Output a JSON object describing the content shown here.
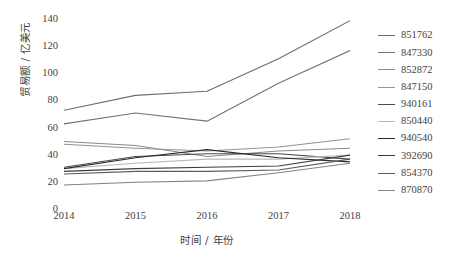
{
  "chart_data": {
    "type": "line",
    "title": "",
    "xlabel": "时间 / 年份",
    "ylabel": "贸易额 / 亿美元",
    "categories": [
      "2014",
      "2015",
      "2016",
      "2017",
      "2018"
    ],
    "x": [
      2014,
      2015,
      2016,
      2017,
      2018
    ],
    "xlim": [
      2014,
      2018
    ],
    "ylim": [
      0,
      140
    ],
    "yticks": [
      0,
      20,
      40,
      60,
      80,
      100,
      120,
      140
    ],
    "grid": false,
    "legend_position": "right",
    "series": [
      {
        "name": "851762",
        "values": [
          72,
          83,
          86,
          110,
          138
        ],
        "color": "#6e6e6e"
      },
      {
        "name": "847330",
        "values": [
          62,
          70,
          64,
          92,
          116
        ],
        "color": "#737373"
      },
      {
        "name": "852872",
        "values": [
          49,
          46,
          38,
          42,
          44
        ],
        "color": "#8a8a8a"
      },
      {
        "name": "847150",
        "values": [
          47,
          44,
          42,
          45,
          51
        ],
        "color": "#949494"
      },
      {
        "name": "940161",
        "values": [
          30,
          38,
          40,
          40,
          36
        ],
        "color": "#4a4a4a"
      },
      {
        "name": "850440",
        "values": [
          29,
          33,
          36,
          36,
          39
        ],
        "color": "#b8b8b8"
      },
      {
        "name": "940540",
        "values": [
          29,
          37,
          43,
          37,
          34
        ],
        "color": "#2b2b2b"
      },
      {
        "name": "392690",
        "values": [
          27,
          29,
          30,
          31,
          39
        ],
        "color": "#3d3d3d"
      },
      {
        "name": "854370",
        "values": [
          25,
          27,
          27,
          28,
          36
        ],
        "color": "#5c5c5c"
      },
      {
        "name": "870870",
        "values": [
          17,
          19,
          20,
          26,
          33
        ],
        "color": "#848484"
      }
    ]
  }
}
